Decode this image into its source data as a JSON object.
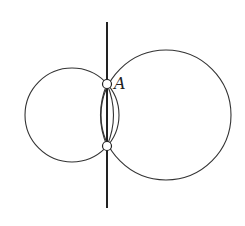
{
  "diagram": {
    "stroke_color": "#333333",
    "background": "#ffffff",
    "line": {
      "x1": 107,
      "y1": 22,
      "x2": 107,
      "y2": 208
    },
    "circles": [
      {
        "name": "left-circle",
        "cx": 72,
        "cy": 115,
        "r": 47
      },
      {
        "name": "right-circle",
        "cx": 166,
        "cy": 115,
        "r": 65
      }
    ],
    "lens_arcs": [
      {
        "name": "lens-left-arc",
        "d": "M107,84 Q94,115 107,146"
      },
      {
        "name": "lens-right-arc",
        "d": "M107,84 Q120,115 107,146"
      }
    ],
    "points": [
      {
        "name": "point-a",
        "cx": 107,
        "cy": 84,
        "r": 4.5,
        "label": "A",
        "label_x": 114,
        "label_y": 89
      },
      {
        "name": "point-b",
        "cx": 107,
        "cy": 146,
        "r": 4.5,
        "label": ""
      }
    ]
  }
}
